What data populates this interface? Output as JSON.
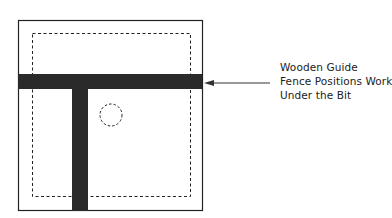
{
  "diagram": {
    "callout": {
      "lines": [
        "Wooden Guide",
        "Fence Positions Work",
        "Under the Bit"
      ]
    },
    "colors": {
      "fence": "#2a2a2a",
      "outline": "#222222",
      "background": "#ffffff"
    },
    "elements": [
      "outer-board",
      "dashed-work-area",
      "horizontal-fence",
      "vertical-fence",
      "bit-circle",
      "arrow"
    ]
  }
}
